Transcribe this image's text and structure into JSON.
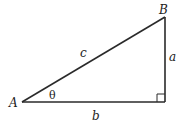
{
  "diagram": {
    "type": "right-triangle",
    "stroke_color": "#2a2a2a",
    "background": "#ffffff",
    "vertices": {
      "A": {
        "label": "A",
        "x": 22,
        "y": 102
      },
      "B": {
        "label": "B",
        "x": 165,
        "y": 17
      },
      "C": {
        "x": 165,
        "y": 102
      }
    },
    "sides": {
      "hypotenuse": {
        "label": "c",
        "from": "A",
        "to": "B"
      },
      "vertical": {
        "label": "a",
        "from": "B",
        "to": "C"
      },
      "base": {
        "label": "b",
        "from": "A",
        "to": "C"
      }
    },
    "angle": {
      "label": "θ",
      "at": "A"
    },
    "right_angle_marker": {
      "at": "C",
      "size": 8
    }
  }
}
